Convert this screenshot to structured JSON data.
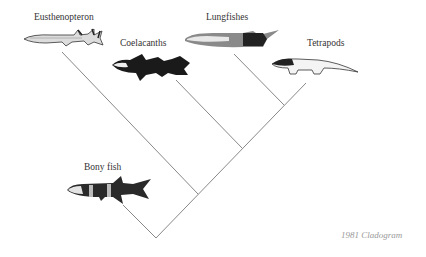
{
  "diagram": {
    "type": "cladogram",
    "caption": "1981 Cladogram",
    "taxa": [
      {
        "label": "Eusthenopteron"
      },
      {
        "label": "Coelacanths"
      },
      {
        "label": "Lungfishes"
      },
      {
        "label": "Tetrapods"
      },
      {
        "label": "Bony fish"
      }
    ],
    "line_color": "#7a7a7a"
  }
}
